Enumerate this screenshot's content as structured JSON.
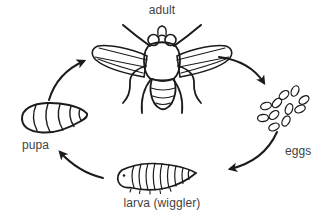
{
  "diagram": {
    "kind": "life-cycle-diagram",
    "labels": {
      "adult": "adult",
      "eggs": "eggs",
      "larva": "larva (wiggler)",
      "pupa": "pupa"
    },
    "stages_order": [
      "adult",
      "eggs",
      "larva (wiggler)",
      "pupa"
    ],
    "colors": {
      "background": "#ffffff",
      "line": "#1b1b1b",
      "text": "#3f3f3f"
    }
  }
}
